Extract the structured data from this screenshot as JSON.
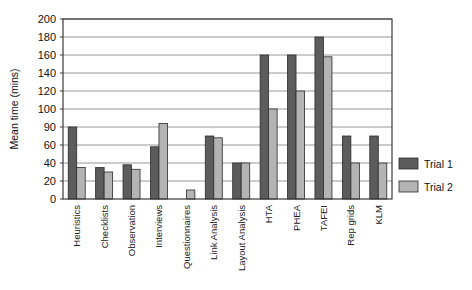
{
  "chart_data": {
    "type": "bar",
    "title": "",
    "xlabel": "",
    "ylabel": "Mean time (mins)",
    "ylim": [
      0,
      200
    ],
    "grid": true,
    "legend_position": "right",
    "categories": [
      "Heuristics",
      "Checklists",
      "Observation",
      "Interviews",
      "Questionnaires",
      "Link Analysis",
      "Layout Analysis",
      "HTA",
      "PHEA",
      "TAFEI",
      "Rep grids",
      "KLM"
    ],
    "ytick_labels": [
      "200",
      "180",
      "160",
      "140",
      "120",
      "100",
      "90",
      "60",
      "40",
      "20",
      "0"
    ],
    "ytick_values": [
      200,
      180,
      160,
      140,
      120,
      100,
      80,
      60,
      40,
      20,
      0
    ],
    "series": [
      {
        "name": "Trial 1",
        "color": "#5c5c5c",
        "values": [
          80,
          35,
          38,
          58,
          0,
          70,
          40,
          160,
          160,
          180,
          70,
          70
        ]
      },
      {
        "name": "Trial 2",
        "color": "#b4b4b4",
        "values": [
          35,
          30,
          33,
          84,
          10,
          68,
          40,
          100,
          120,
          158,
          40,
          40
        ]
      }
    ]
  },
  "legend": {
    "items": [
      {
        "label": "Trial 1",
        "color": "#5c5c5c"
      },
      {
        "label": "Trial 2",
        "color": "#b4b4b4"
      }
    ]
  },
  "style": {
    "bar_stroke": "#2b2b2b",
    "grid_color": "#8a8a8a",
    "axis_color": "#3a3a3a",
    "plot_background": "#ffffff",
    "page_background": "#ffffff"
  }
}
